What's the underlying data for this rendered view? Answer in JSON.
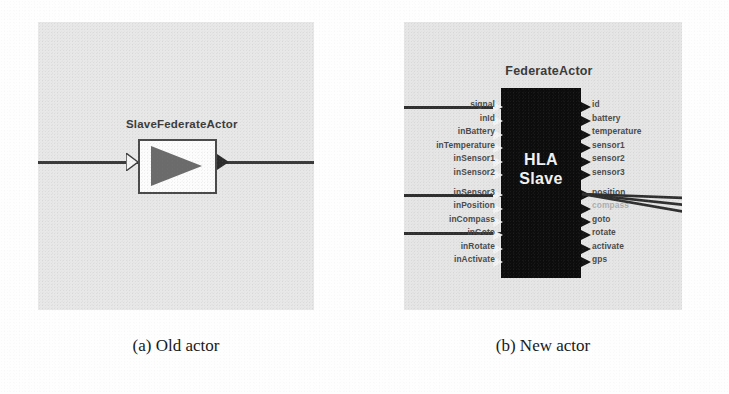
{
  "figure": {
    "type": "actor-diagram-comparison",
    "background_color": "#fefefe",
    "panel_color": "#e8e8e8"
  },
  "subfigures": [
    {
      "id": "a",
      "caption": "(a) Old actor",
      "actor": {
        "name": "SlaveFederateActor",
        "icon": "triangle-right",
        "box_fill": "#fdfdfd",
        "box_border": "#4a4a4a",
        "inputs": [
          {
            "name": "input",
            "port_style": "hollow-triangle"
          }
        ],
        "outputs": [
          {
            "name": "output",
            "port_style": "filled-triangle"
          }
        ],
        "wire_color": "#3a3a3a"
      }
    },
    {
      "id": "b",
      "caption": "(b) New actor",
      "actor": {
        "name": "FederateActor",
        "block_label_line1": "HLA",
        "block_label_line2": "Slave",
        "block_fill": "#0c0c0c",
        "block_text_color": "#f4f4f4",
        "inputs": [
          {
            "label": "signal",
            "connected": true
          },
          {
            "label": "inId",
            "connected": false
          },
          {
            "label": "inBattery",
            "connected": false
          },
          {
            "label": "inTemperature",
            "connected": false
          },
          {
            "label": "inSensor1",
            "connected": false
          },
          {
            "label": "inSensor2",
            "connected": false
          },
          {
            "label": "inSensor3",
            "connected": true
          },
          {
            "label": "inPosition",
            "connected": false
          },
          {
            "label": "inCompass",
            "connected": false
          },
          {
            "label": "inGoto",
            "connected": true
          },
          {
            "label": "inRotate",
            "connected": false
          },
          {
            "label": "inActivate",
            "connected": false
          }
        ],
        "outputs": [
          {
            "label": "id",
            "connected": false
          },
          {
            "label": "battery",
            "connected": false
          },
          {
            "label": "temperature",
            "connected": false
          },
          {
            "label": "sensor1",
            "connected": false
          },
          {
            "label": "sensor2",
            "connected": false
          },
          {
            "label": "sensor3",
            "connected": false
          },
          {
            "label": "position",
            "connected": true
          },
          {
            "label": "compass",
            "connected": true,
            "obscured_by_wires": true
          },
          {
            "label": "goto",
            "connected": true
          },
          {
            "label": "rotate",
            "connected": false
          },
          {
            "label": "activate",
            "connected": false
          },
          {
            "label": "gps",
            "connected": false
          }
        ]
      }
    }
  ]
}
